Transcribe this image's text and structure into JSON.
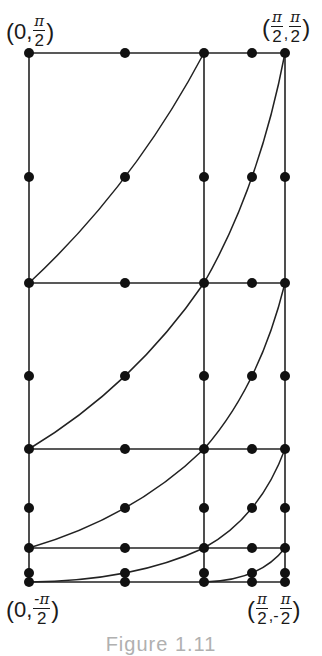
{
  "figure": {
    "caption": "Figure 1.11",
    "stroke_color": "#222222",
    "dot_color": "#111111",
    "labels": {
      "top_left": {
        "open": "(",
        "first": "0,",
        "num": "π",
        "den": "2",
        "close": ")",
        "sign": ""
      },
      "top_right": {
        "open": "(",
        "num1": "π",
        "den1": "2",
        "sep": ",",
        "num2": "π",
        "den2": "2",
        "close": ")"
      },
      "bottom_left": {
        "open": "(",
        "first": "0,",
        "num": "-π",
        "den": "2",
        "close": ")"
      },
      "bottom_right": {
        "open": "(",
        "num1": "π",
        "den1": "2",
        "sep": ",-",
        "num2": "π",
        "den2": "2",
        "close": ")"
      }
    },
    "corner_coordinates": {
      "top_left": "(0, π/2)",
      "top_right": "(π/2, π/2)",
      "bottom_left": "(0, -π/2)",
      "bottom_right": "(π/2, -π/2)"
    },
    "columns_x": [
      29,
      125,
      204,
      252,
      285
    ],
    "rows_y": [
      53,
      177,
      283,
      376,
      449,
      508,
      548,
      573,
      582
    ],
    "horizontal_lines_y": [
      53,
      283,
      449,
      548,
      582
    ],
    "vertical_lines_x": [
      29,
      204,
      285
    ],
    "curves": [
      [
        [
          29,
          283
        ],
        [
          125,
          177
        ],
        [
          204,
          53
        ]
      ],
      [
        [
          204,
          283
        ],
        [
          252,
          177
        ],
        [
          285,
          53
        ]
      ],
      [
        [
          29,
          449
        ],
        [
          125,
          376
        ],
        [
          204,
          283
        ]
      ],
      [
        [
          204,
          449
        ],
        [
          252,
          376
        ],
        [
          285,
          283
        ]
      ],
      [
        [
          29,
          548
        ],
        [
          125,
          508
        ],
        [
          204,
          449
        ]
      ],
      [
        [
          204,
          548
        ],
        [
          252,
          508
        ],
        [
          285,
          449
        ]
      ],
      [
        [
          29,
          582
        ],
        [
          125,
          573
        ],
        [
          204,
          548
        ]
      ],
      [
        [
          204,
          582
        ],
        [
          252,
          573
        ],
        [
          285,
          548
        ]
      ]
    ]
  }
}
